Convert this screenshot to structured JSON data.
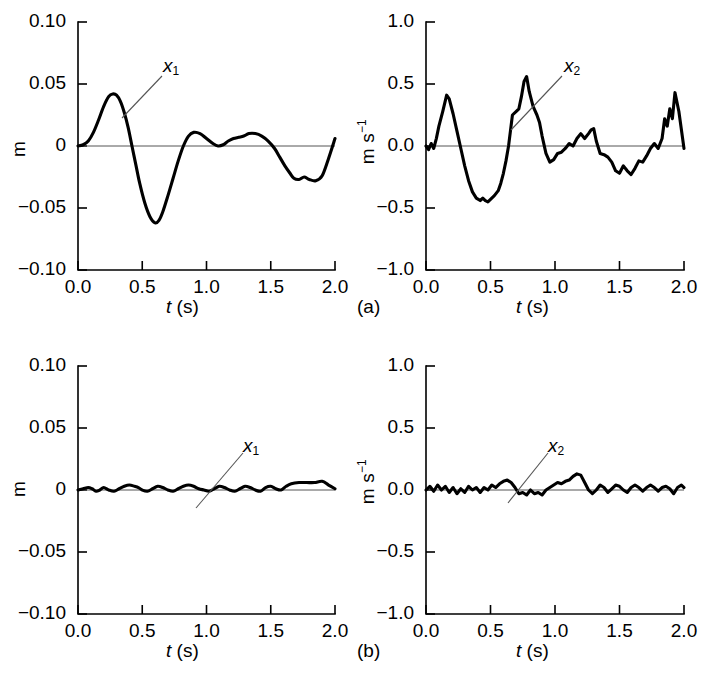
{
  "figure": {
    "panel_a_label": "(a)",
    "panel_b_label": "(b)"
  },
  "chart_data": [
    {
      "id": "a-left",
      "type": "line",
      "title": "",
      "xlabel": "t (s)",
      "ylabel": "m",
      "xlim": [
        0.0,
        2.0
      ],
      "ylim": [
        -0.1,
        0.1
      ],
      "xticks": [
        "0.0",
        "0.5",
        "1.0",
        "1.5",
        "2.0"
      ],
      "yticks": [
        "0.10",
        "0.05",
        "0",
        "-0.05",
        "-0.10"
      ],
      "xtick_values": [
        0.0,
        0.5,
        1.0,
        1.5,
        2.0
      ],
      "ytick_values": [
        0.1,
        0.05,
        0,
        -0.05,
        -0.1
      ],
      "grid": false,
      "zero_line": true,
      "annotation": "x1",
      "annotation_text": "x",
      "annotation_sub": "1",
      "series": [
        {
          "name": "x1",
          "x": [
            0.0,
            0.04,
            0.08,
            0.12,
            0.16,
            0.2,
            0.24,
            0.27,
            0.3,
            0.33,
            0.36,
            0.39,
            0.42,
            0.45,
            0.48,
            0.52,
            0.56,
            0.6,
            0.63,
            0.66,
            0.7,
            0.74,
            0.78,
            0.82,
            0.86,
            0.9,
            0.95,
            1.0,
            1.05,
            1.09,
            1.13,
            1.17,
            1.21,
            1.25,
            1.29,
            1.33,
            1.38,
            1.43,
            1.48,
            1.53,
            1.57,
            1.61,
            1.65,
            1.68,
            1.72,
            1.76,
            1.8,
            1.85,
            1.9,
            1.95,
            2.0
          ],
          "y": [
            0.0,
            0.001,
            0.004,
            0.011,
            0.021,
            0.032,
            0.04,
            0.042,
            0.041,
            0.036,
            0.027,
            0.015,
            0.0,
            -0.015,
            -0.03,
            -0.046,
            -0.057,
            -0.062,
            -0.06,
            -0.053,
            -0.04,
            -0.026,
            -0.012,
            0.0,
            0.008,
            0.011,
            0.01,
            0.006,
            0.002,
            0.0,
            0.001,
            0.004,
            0.006,
            0.007,
            0.008,
            0.01,
            0.01,
            0.008,
            0.004,
            -0.002,
            -0.009,
            -0.016,
            -0.022,
            -0.026,
            -0.027,
            -0.025,
            -0.027,
            -0.028,
            -0.024,
            -0.01,
            0.006,
            0.03
          ]
        }
      ]
    },
    {
      "id": "a-right",
      "type": "line",
      "title": "",
      "xlabel": "t (s)",
      "ylabel": "m s-1",
      "xlim": [
        0.0,
        2.0
      ],
      "ylim": [
        -1.0,
        1.0
      ],
      "xticks": [
        "0.0",
        "0.5",
        "1.0",
        "1.5",
        "2.0"
      ],
      "yticks": [
        "1.0",
        "0.5",
        "0.0",
        "-0.5",
        "-1.0"
      ],
      "xtick_values": [
        0.0,
        0.5,
        1.0,
        1.5,
        2.0
      ],
      "ytick_values": [
        1.0,
        0.5,
        0.0,
        -0.5,
        -1.0
      ],
      "grid": false,
      "zero_line": true,
      "annotation": "x2",
      "annotation_text": "x",
      "annotation_sub": "2",
      "series": [
        {
          "name": "x2",
          "x": [
            0.0,
            0.02,
            0.04,
            0.06,
            0.08,
            0.1,
            0.13,
            0.16,
            0.18,
            0.21,
            0.24,
            0.27,
            0.3,
            0.33,
            0.36,
            0.39,
            0.42,
            0.44,
            0.46,
            0.48,
            0.5,
            0.53,
            0.56,
            0.58,
            0.6,
            0.62,
            0.64,
            0.67,
            0.7,
            0.72,
            0.74,
            0.76,
            0.78,
            0.8,
            0.83,
            0.86,
            0.88,
            0.9,
            0.93,
            0.96,
            0.99,
            1.02,
            1.05,
            1.08,
            1.11,
            1.14,
            1.17,
            1.2,
            1.23,
            1.26,
            1.28,
            1.3,
            1.32,
            1.35,
            1.38,
            1.41,
            1.44,
            1.47,
            1.5,
            1.53,
            1.56,
            1.59,
            1.62,
            1.65,
            1.68,
            1.71,
            1.74,
            1.77,
            1.8,
            1.83,
            1.85,
            1.87,
            1.89,
            1.91,
            1.93,
            1.96,
            2.0
          ],
          "y": [
            0.0,
            -0.03,
            0.02,
            -0.02,
            0.06,
            0.16,
            0.28,
            0.41,
            0.38,
            0.26,
            0.12,
            -0.02,
            -0.16,
            -0.28,
            -0.37,
            -0.42,
            -0.44,
            -0.42,
            -0.44,
            -0.45,
            -0.43,
            -0.4,
            -0.36,
            -0.3,
            -0.22,
            -0.12,
            0.0,
            0.25,
            0.28,
            0.3,
            0.4,
            0.52,
            0.56,
            0.44,
            0.32,
            0.25,
            0.19,
            0.08,
            -0.06,
            -0.13,
            -0.11,
            -0.06,
            -0.05,
            -0.02,
            0.02,
            0.0,
            0.06,
            0.1,
            0.06,
            0.1,
            0.13,
            0.14,
            0.04,
            -0.06,
            -0.07,
            -0.09,
            -0.13,
            -0.2,
            -0.22,
            -0.16,
            -0.2,
            -0.23,
            -0.18,
            -0.12,
            -0.13,
            -0.08,
            -0.02,
            0.02,
            -0.02,
            0.06,
            0.22,
            0.16,
            0.3,
            0.22,
            0.43,
            0.28,
            -0.02
          ]
        }
      ]
    },
    {
      "id": "b-left",
      "type": "line",
      "title": "",
      "xlabel": "t (s)",
      "ylabel": "m",
      "xlim": [
        0.0,
        2.0
      ],
      "ylim": [
        -0.1,
        0.1
      ],
      "xticks": [
        "0.0",
        "0.5",
        "1.0",
        "1.5",
        "2.0"
      ],
      "yticks": [
        "0.10",
        "0.05",
        "0",
        "-0.05",
        "-0.10"
      ],
      "xtick_values": [
        0.0,
        0.5,
        1.0,
        1.5,
        2.0
      ],
      "ytick_values": [
        0.1,
        0.05,
        0,
        -0.05,
        -0.1
      ],
      "grid": false,
      "zero_line": true,
      "annotation": "x1",
      "annotation_text": "x",
      "annotation_sub": "1",
      "series": [
        {
          "name": "x1",
          "x": [
            0.0,
            0.04,
            0.08,
            0.11,
            0.14,
            0.17,
            0.2,
            0.24,
            0.28,
            0.32,
            0.36,
            0.4,
            0.44,
            0.47,
            0.5,
            0.54,
            0.58,
            0.62,
            0.66,
            0.7,
            0.74,
            0.78,
            0.82,
            0.86,
            0.9,
            0.94,
            0.98,
            1.02,
            1.06,
            1.1,
            1.14,
            1.18,
            1.22,
            1.26,
            1.3,
            1.34,
            1.38,
            1.42,
            1.46,
            1.5,
            1.54,
            1.58,
            1.62,
            1.66,
            1.72,
            1.78,
            1.84,
            1.9,
            1.95,
            2.0
          ],
          "y": [
            0.0,
            0.001,
            0.002,
            0.001,
            -0.001,
            0.0,
            0.002,
            0.0,
            -0.001,
            0.001,
            0.003,
            0.004,
            0.003,
            0.002,
            0.0,
            -0.001,
            0.001,
            0.003,
            0.002,
            0.0,
            -0.001,
            0.001,
            0.003,
            0.004,
            0.003,
            0.001,
            0.0,
            -0.001,
            0.001,
            0.003,
            0.002,
            0.0,
            -0.001,
            0.001,
            0.003,
            0.002,
            0.0,
            -0.001,
            0.002,
            0.003,
            0.001,
            0.0,
            0.003,
            0.005,
            0.006,
            0.006,
            0.006,
            0.007,
            0.004,
            0.001
          ]
        }
      ]
    },
    {
      "id": "b-right",
      "type": "line",
      "title": "",
      "xlabel": "t (s)",
      "ylabel": "m s-1",
      "xlim": [
        0.0,
        2.0
      ],
      "ylim": [
        -1.0,
        1.0
      ],
      "xticks": [
        "0.0",
        "0.5",
        "1.0",
        "1.5",
        "2.0"
      ],
      "yticks": [
        "1.0",
        "0.5",
        "0.0",
        "-0.5",
        "-1.0"
      ],
      "xtick_values": [
        0.0,
        0.5,
        1.0,
        1.5,
        2.0
      ],
      "ytick_values": [
        1.0,
        0.5,
        0.0,
        -0.5,
        -1.0
      ],
      "grid": false,
      "zero_line": true,
      "annotation": "x2",
      "annotation_text": "x",
      "annotation_sub": "2",
      "series": [
        {
          "name": "x2",
          "x": [
            0.0,
            0.03,
            0.06,
            0.09,
            0.12,
            0.15,
            0.18,
            0.21,
            0.24,
            0.27,
            0.3,
            0.33,
            0.36,
            0.39,
            0.42,
            0.45,
            0.48,
            0.51,
            0.54,
            0.57,
            0.6,
            0.63,
            0.66,
            0.69,
            0.72,
            0.75,
            0.78,
            0.81,
            0.84,
            0.87,
            0.9,
            0.93,
            0.96,
            0.99,
            1.02,
            1.05,
            1.08,
            1.11,
            1.14,
            1.17,
            1.2,
            1.23,
            1.26,
            1.29,
            1.32,
            1.35,
            1.38,
            1.41,
            1.44,
            1.47,
            1.5,
            1.53,
            1.56,
            1.59,
            1.62,
            1.65,
            1.68,
            1.71,
            1.74,
            1.77,
            1.8,
            1.83,
            1.86,
            1.89,
            1.92,
            1.95,
            1.98,
            2.0
          ],
          "y": [
            0.0,
            0.03,
            -0.01,
            0.04,
            0.0,
            0.03,
            -0.02,
            0.02,
            -0.03,
            0.01,
            -0.02,
            0.03,
            0.0,
            0.02,
            -0.02,
            0.02,
            0.0,
            0.04,
            0.02,
            0.05,
            0.07,
            0.08,
            0.06,
            0.02,
            -0.03,
            -0.02,
            -0.04,
            0.0,
            -0.03,
            -0.02,
            -0.04,
            0.0,
            0.02,
            0.04,
            0.06,
            0.05,
            0.07,
            0.08,
            0.11,
            0.13,
            0.12,
            0.06,
            0.0,
            -0.03,
            0.0,
            0.04,
            0.02,
            -0.02,
            0.01,
            0.04,
            0.03,
            0.0,
            -0.02,
            0.02,
            0.04,
            0.02,
            -0.01,
            0.02,
            0.04,
            0.02,
            -0.01,
            0.02,
            0.03,
            0.01,
            -0.03,
            0.02,
            0.04,
            0.02
          ]
        }
      ]
    }
  ]
}
